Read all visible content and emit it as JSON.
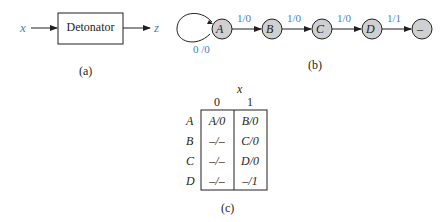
{
  "part_a": {
    "input_label": "x",
    "block_label": "Detonator",
    "output_label": "z",
    "caption": "(a)"
  },
  "part_b": {
    "states": [
      "A",
      "B",
      "C",
      "D",
      "–"
    ],
    "self_loop_label": "0 /0",
    "transitions": [
      "1/0",
      "1/0",
      "1/0",
      "1/1"
    ],
    "caption": "(b)",
    "colors": {
      "state_fill": "#cfd0d2",
      "label": "#3f7fc3"
    }
  },
  "part_c": {
    "input_header": "x",
    "columns": [
      "0",
      "1"
    ],
    "rows": [
      {
        "state": "A",
        "cells": [
          "A/0",
          "B/0"
        ]
      },
      {
        "state": "B",
        "cells": [
          "–/–",
          "C/0"
        ]
      },
      {
        "state": "C",
        "cells": [
          "–/–",
          "D/0"
        ]
      },
      {
        "state": "D",
        "cells": [
          "–/–",
          "–/1"
        ]
      }
    ],
    "caption": "(c)"
  }
}
